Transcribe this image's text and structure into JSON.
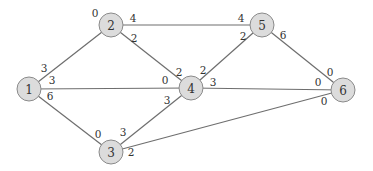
{
  "diagram": {
    "type": "weighted-graph",
    "nodes": [
      {
        "id": "1",
        "label": "1",
        "x": 29,
        "y": 89
      },
      {
        "id": "2",
        "label": "2",
        "x": 111,
        "y": 25
      },
      {
        "id": "3",
        "label": "3",
        "x": 111,
        "y": 152
      },
      {
        "id": "4",
        "label": "4",
        "x": 191,
        "y": 88
      },
      {
        "id": "5",
        "label": "5",
        "x": 262,
        "y": 25
      },
      {
        "id": "6",
        "label": "6",
        "x": 343,
        "y": 90
      }
    ],
    "edges": [
      {
        "from": "1",
        "to": "2",
        "label_from": "3",
        "label_to": "0",
        "lf": [
          44,
          68
        ],
        "lt": [
          95,
          13
        ]
      },
      {
        "from": "1",
        "to": "4",
        "label_from": "3",
        "label_to": "0",
        "lf": [
          52,
          80
        ],
        "lt": [
          165,
          80
        ]
      },
      {
        "from": "1",
        "to": "3",
        "label_from": "6",
        "label_to": "0",
        "lf": [
          50,
          96
        ],
        "lt": [
          98,
          134
        ]
      },
      {
        "from": "2",
        "to": "5",
        "label_from": "4",
        "label_to": "4",
        "lf": [
          133,
          18
        ],
        "lt": [
          241,
          18
        ]
      },
      {
        "from": "2",
        "to": "4",
        "label_from": "2",
        "label_to": "2",
        "lf": [
          134,
          38
        ],
        "lt": [
          179,
          72
        ]
      },
      {
        "from": "3",
        "to": "4",
        "label_from": "3",
        "label_to": "3",
        "lf": [
          123,
          132
        ],
        "lt": [
          167,
          100
        ]
      },
      {
        "from": "3",
        "to": "6",
        "label_from": "2",
        "label_to": "0",
        "lf": [
          131,
          152
        ],
        "lt": [
          324,
          101
        ]
      },
      {
        "from": "4",
        "to": "5",
        "label_from": "2",
        "label_to": "2",
        "lf": [
          203,
          70
        ],
        "lt": [
          243,
          36
        ]
      },
      {
        "from": "4",
        "to": "6",
        "label_from": "3",
        "label_to": "0",
        "lf": [
          213,
          82
        ],
        "lt": [
          318,
          82
        ]
      },
      {
        "from": "5",
        "to": "6",
        "label_from": "6",
        "label_to": "0",
        "lf": [
          283,
          35
        ],
        "lt": [
          330,
          72
        ]
      }
    ],
    "colors": {
      "node_fill": "#dcdcdc",
      "node_stroke": "#8a8a8a",
      "edge": "#6e6e6e",
      "text": "#333333"
    }
  }
}
